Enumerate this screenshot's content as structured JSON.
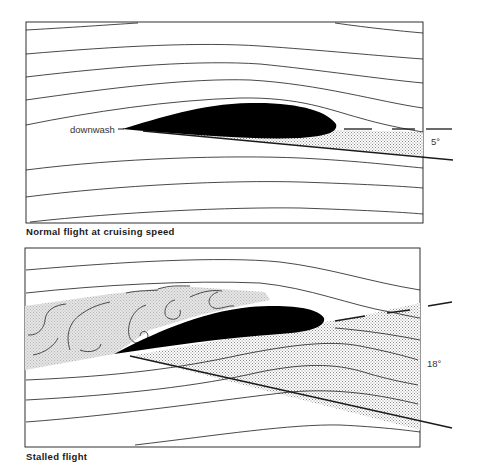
{
  "figure": {
    "colors": {
      "background": "#ffffff",
      "line": "#1a1a1a",
      "airfoil_fill": "#000000",
      "stipple": "#9a9a9a",
      "turbulence_fill": "#dcdcdc"
    },
    "panels": [
      {
        "id": "normal",
        "caption": "Normal flight at cruising speed",
        "angle_label": "5°",
        "annotation": "downwash",
        "angle_of_attack_deg": 5
      },
      {
        "id": "stalled",
        "caption": "Stalled flight",
        "angle_label": "18°",
        "angle_of_attack_deg": 18
      }
    ]
  }
}
